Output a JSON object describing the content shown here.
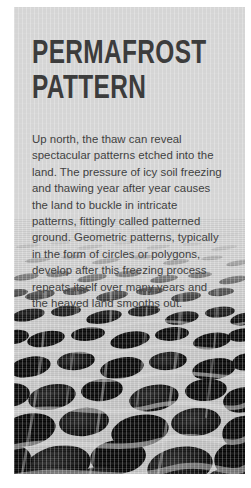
{
  "card": {
    "background_color": "#d5d5d5",
    "title": "Permafrost\nPattern",
    "body": "Up north, the thaw can reveal spectacular patterns etched into the land. The pressure of icy soil freezing and thawing year after year causes the land to buckle in intricate patterns, fittingly called patterned ground. Geometric patterns, typically in the form of circles or polygons, develop after this freezing process repeats itself over many years and the heaved land smooths out.",
    "title_color": "#3c3c3c",
    "body_color": "#3f3f3f"
  },
  "photo": {
    "alt": "patterned-ground-photo",
    "caption": "",
    "description": "Aerial perspective photograph of polygonal patterned ground with dark peat-filled cells separated by pale ridges",
    "ink_color": "#101010",
    "ground_color": "#cfcfcf"
  }
}
